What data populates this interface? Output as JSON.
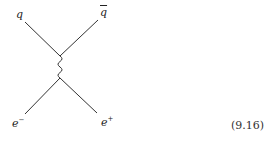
{
  "diagram": {
    "type": "feynman",
    "labels": {
      "q": "q",
      "qbar": "q",
      "e_minus": "e",
      "e_minus_sup": "−",
      "e_plus": "e",
      "e_plus_sup": "+"
    },
    "equation_number": "(9.16)",
    "colors": {
      "line": "#333333",
      "background": "#ffffff"
    }
  }
}
